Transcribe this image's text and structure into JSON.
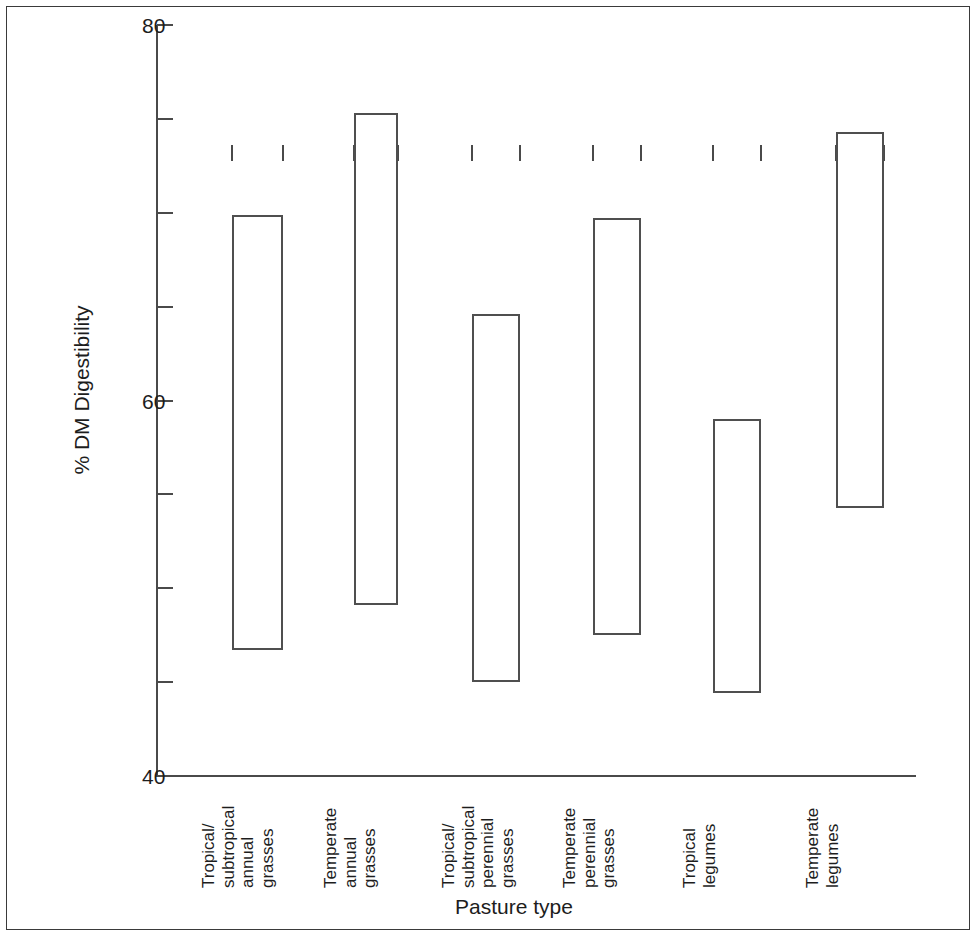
{
  "chart_data": {
    "type": "bar",
    "title": "",
    "subtitle": "",
    "xlabel": "Pasture type",
    "ylabel": "% DM Digestibility",
    "ylim": [
      40,
      80
    ],
    "yticks": [
      40,
      45,
      50,
      55,
      60,
      65,
      70,
      75,
      80
    ],
    "ytick_labels": [
      "40",
      "",
      "",
      "",
      "60",
      "",
      "",
      "",
      "80"
    ],
    "grid": false,
    "legend": null,
    "bar_style": "hollow-range-bar",
    "note": "Each bar is a floating range bar spanning minimum to maximum % DM digestibility for that pasture type.",
    "categories": [
      "Tropical/ subtropical annual grasses",
      "Temperate annual grasses",
      "Tropical/ subtropical perennial grasses",
      "Temperate perennial grasses",
      "Tropical legumes",
      "Temperate legumes"
    ],
    "category_lines": [
      [
        "Tropical/",
        "subtropical",
        "annual",
        "grasses"
      ],
      [
        "Temperate",
        "annual",
        "grasses"
      ],
      [
        "Tropical/",
        "subtropical",
        "perennial",
        "grasses"
      ],
      [
        "Temperate",
        "perennial",
        "grasses"
      ],
      [
        "Tropical",
        "legumes"
      ],
      [
        "Temperate",
        "legumes"
      ]
    ],
    "series": [
      {
        "name": "minimum",
        "values": [
          46.7,
          49.1,
          45.0,
          47.5,
          44.4,
          54.3
        ]
      },
      {
        "name": "maximum",
        "values": [
          69.9,
          75.3,
          64.6,
          69.7,
          59.0,
          74.3
        ]
      }
    ],
    "bars": [
      {
        "category": "Tropical/ subtropical annual grasses",
        "low": 46.7,
        "high": 69.9
      },
      {
        "category": "Temperate annual grasses",
        "low": 49.1,
        "high": 75.3
      },
      {
        "category": "Tropical/ subtropical perennial grasses",
        "low": 45.0,
        "high": 64.6
      },
      {
        "category": "Temperate perennial grasses",
        "low": 47.5,
        "high": 69.7
      },
      {
        "category": "Tropical legumes",
        "low": 44.4,
        "high": 59.0
      },
      {
        "category": "Temperate legumes",
        "low": 54.3,
        "high": 74.3
      }
    ],
    "colors": {
      "background": "#ffffff",
      "axis": "#4a4a4a",
      "bar_outline": "#4f4f4f",
      "bar_fill": "transparent",
      "text": "#1d1d1d",
      "frame": "#3a3a3a"
    }
  }
}
